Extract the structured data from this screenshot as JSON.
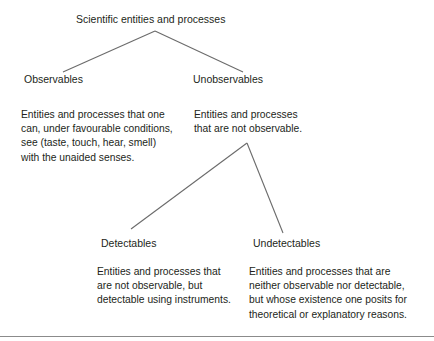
{
  "diagram": {
    "title_node": {
      "label": "Scientific entities and processes"
    },
    "level2": [
      {
        "label": "Observables"
      },
      {
        "label": "Unobservables"
      }
    ],
    "level3": [
      {
        "label": "Detectables"
      },
      {
        "label": "Undetectables"
      }
    ],
    "descriptions": {
      "observables": {
        "lines": [
          "Entities and processes that one",
          "can, under favourable conditions,",
          "see (taste, touch, hear, smell)",
          "with the unaided senses."
        ]
      },
      "unobservables": {
        "lines": [
          "Entities and processes",
          "that are not observable."
        ]
      },
      "detectables": {
        "lines": [
          "Entities and processes that",
          "are not observable, but",
          "detectable using instruments."
        ]
      },
      "undetectables": {
        "lines": [
          "Entities and processes that are",
          "neither observable nor detectable,",
          "but whose existence one posits for",
          "theoretical or explanatory reasons."
        ]
      }
    },
    "colors": {
      "text": "#231f20",
      "connector": "#6b6b6b",
      "rule": "#8b8b8b",
      "background": "#ffffff"
    }
  }
}
